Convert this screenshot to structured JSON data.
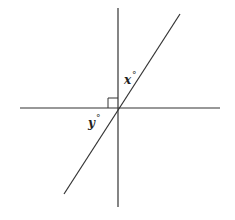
{
  "figure": {
    "type": "geometry-angles",
    "labels": {
      "x": "x",
      "y": "y",
      "degree_symbol": "°"
    },
    "lines": {
      "horizontal": {
        "x1": 20,
        "y1": 108,
        "x2": 220,
        "y2": 108
      },
      "vertical": {
        "x1": 118,
        "y1": 8,
        "x2": 118,
        "y2": 207
      },
      "slanted": {
        "x1": 180,
        "y1": 14,
        "x2": 64,
        "y2": 194
      }
    },
    "right_angle_marker": {
      "x": 108,
      "y": 98,
      "size": 10
    },
    "stroke_color": "#333333"
  }
}
